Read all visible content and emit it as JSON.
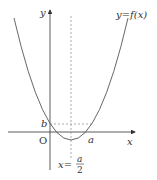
{
  "diagram": {
    "function_label": "y=f(x)",
    "x_axis_label": "x",
    "y_axis_label": "y",
    "origin_label": "O",
    "b_label": "b",
    "a_label": "a",
    "axis_of_symmetry": {
      "lhs": "x=",
      "num": "a",
      "den": "2"
    },
    "colors": {
      "curve": "#555555",
      "axis": "#333333",
      "dashed": "#888888"
    }
  }
}
